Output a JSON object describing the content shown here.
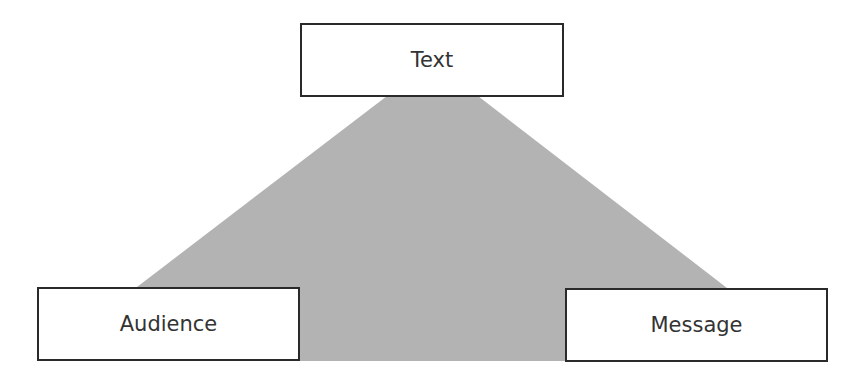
{
  "diagram": {
    "type": "triangle-relationship",
    "shade_color": "#b3b3b3",
    "border_color": "#2a2a2a",
    "text_color": "#333333",
    "nodes": {
      "top": {
        "label": "Text"
      },
      "bottom_left": {
        "label": "Audience"
      },
      "bottom_right": {
        "label": "Message"
      }
    }
  }
}
